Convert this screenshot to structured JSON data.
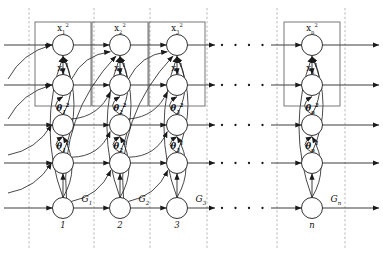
{
  "figure": {
    "type": "dynamic-bayesian-network",
    "width": 383,
    "height": 257,
    "background": "#ffffff",
    "stroke_color": "#1a1a1a",
    "node_fill": "#ffffff",
    "plate_color": "#555555",
    "dash_color": "#999999"
  },
  "rows": [
    {
      "id": "x2",
      "y": 45,
      "label_prefix": "x",
      "superscript": "2",
      "kind": "state"
    },
    {
      "id": "x1",
      "y": 85,
      "label_prefix": "x",
      "superscript": "1",
      "kind": "state"
    },
    {
      "id": "th2",
      "y": 125,
      "label_prefix": "θ",
      "superscript": "2",
      "kind": "param"
    },
    {
      "id": "th1",
      "y": 163,
      "label_prefix": "θ",
      "superscript": "1",
      "kind": "param"
    },
    {
      "id": "g",
      "y": 208,
      "label_prefix": "G",
      "superscript": "",
      "kind": "gate"
    }
  ],
  "columns": [
    {
      "index": 1,
      "x": 63,
      "slice_label": "1",
      "subscript": "1",
      "is_ellipsis": false
    },
    {
      "index": 2,
      "x": 120,
      "slice_label": "2",
      "subscript": "2",
      "is_ellipsis": false
    },
    {
      "index": 3,
      "x": 177,
      "slice_label": "3",
      "subscript": "3",
      "is_ellipsis": false
    },
    {
      "index": 4,
      "x": 243,
      "slice_label": "",
      "subscript": "",
      "is_ellipsis": true
    },
    {
      "index": 5,
      "x": 312,
      "slice_label": "n",
      "subscript": "n",
      "is_ellipsis": false
    }
  ],
  "node_labels": {
    "x2": [
      "x₁²",
      "x₂²",
      "x₃²",
      "",
      "xₙ²"
    ],
    "x1": [
      "x₁¹",
      "x₂¹",
      "x₃¹",
      "",
      "xₙ¹"
    ],
    "th2": [
      "θ₁²",
      "θ₂²",
      "θ₃²",
      "",
      "θₙ²"
    ],
    "th1": [
      "θ₁¹",
      "θ₂¹",
      "θ₃¹",
      "",
      "θₙ¹"
    ],
    "g": [
      "G₁",
      "G₂",
      "G₃",
      "",
      "Gₙ"
    ]
  },
  "slice_numbers": [
    "1",
    "2",
    "3",
    "n"
  ],
  "gate_labels": [
    "G",
    "G",
    "G",
    "G"
  ],
  "gate_subscripts": [
    "1",
    "2",
    "3",
    "n"
  ],
  "ellipsis": {
    "dot_count": 4,
    "glyph": "·"
  },
  "plates": {
    "count": 4,
    "top": 22,
    "bottom": 106,
    "half_width": 28,
    "note": "rectangle enclosing x-superscript-2 and x-superscript-1 nodes per slice"
  },
  "dashed_separators_x": [
    29,
    94,
    150,
    207,
    277,
    345
  ],
  "geometry": {
    "node_radius": 10.5,
    "arrow_head_size": 4
  }
}
